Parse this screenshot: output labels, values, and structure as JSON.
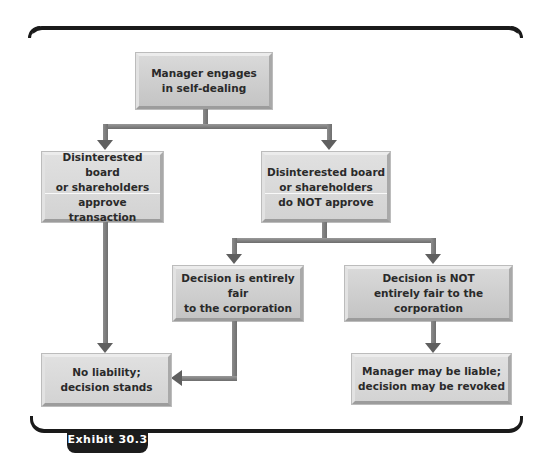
{
  "exhibit": {
    "label": "Exhibit 30.3"
  },
  "diagram": {
    "type": "flowchart",
    "nodes": {
      "start": {
        "label": "Manager engages\nin self-dealing"
      },
      "approve": {
        "label": "Disinterested board\nor shareholders\napprove transaction"
      },
      "not_approve": {
        "label": "Disinterested board\nor shareholders\ndo NOT approve"
      },
      "fair": {
        "label": "Decision is entirely fair\nto the corporation"
      },
      "not_fair": {
        "label": "Decision is NOT\nentirely fair to the corporation"
      },
      "no_liability": {
        "label": "No liability;\ndecision stands"
      },
      "liable": {
        "label": "Manager may be liable;\ndecision may be revoked"
      }
    },
    "edges": [
      {
        "from": "start",
        "to": "approve"
      },
      {
        "from": "start",
        "to": "not_approve"
      },
      {
        "from": "not_approve",
        "to": "fair"
      },
      {
        "from": "not_approve",
        "to": "not_fair"
      },
      {
        "from": "approve",
        "to": "no_liability"
      },
      {
        "from": "fair",
        "to": "no_liability"
      },
      {
        "from": "not_fair",
        "to": "liable"
      }
    ],
    "colors": {
      "box_fill": "#cfcfcf",
      "arrow": "#6f6f6f",
      "frame": "#1a1a1a"
    }
  }
}
